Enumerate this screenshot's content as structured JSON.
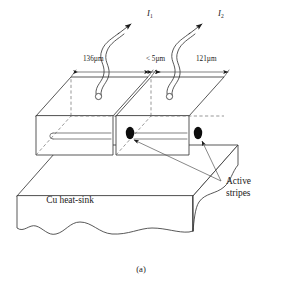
{
  "figure": {
    "caption": "(a)",
    "type": "technical-line-diagram"
  },
  "labels": {
    "heat_sink": "Cu heat-sink",
    "active_stripes_line1": "Active",
    "active_stripes_line2": "stripes"
  },
  "currents": [
    {
      "name": "current-1",
      "symbol": "I",
      "subscript": "1"
    },
    {
      "name": "current-2",
      "symbol": "I",
      "subscript": "2"
    }
  ],
  "dimensions": [
    {
      "name": "left-bar-width",
      "text": "136µm"
    },
    {
      "name": "gap-width",
      "text": "< 5µm"
    },
    {
      "name": "right-bar-width",
      "text": "121µm"
    }
  ],
  "colors": {
    "background": "#ffffff",
    "line": "#3a3a3a",
    "dashed": "#6a6a6a",
    "marker": "#0d0d0d",
    "text": "#1a1a1a"
  }
}
